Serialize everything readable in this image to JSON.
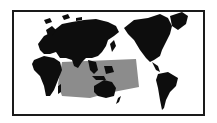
{
  "map": {
    "projection": "pacific-centered world map",
    "colors": {
      "land": "#0d0d0d",
      "highlight_region": "#8c8c8c",
      "background": "#ffffff",
      "frame": "#1a1a1a"
    },
    "highlighted_region": "Indo-Pacific (Indian Ocean to central Pacific)"
  }
}
